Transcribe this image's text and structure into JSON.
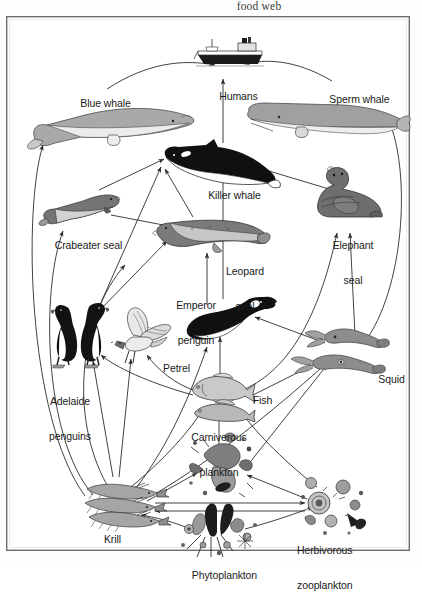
{
  "caption": "food web",
  "diagram": {
    "type": "food-web",
    "title": "food web",
    "region": "Antarctic / Southern Ocean",
    "frame": {
      "x": 6,
      "y": 16,
      "width": 404,
      "height": 535
    },
    "nodes": [
      {
        "id": "ship",
        "label": "",
        "icon": "ship-icon",
        "x": 223,
        "y": 45,
        "label_x": 223,
        "label_y": 68,
        "lines": []
      },
      {
        "id": "humans",
        "label": "Humans",
        "icon": "humans-icon",
        "x": 223,
        "y": 45,
        "label_x": 223,
        "label_y": 68,
        "lines": [
          "Humans"
        ]
      },
      {
        "id": "bluewhale",
        "label": "Blue whale",
        "icon": "blue-whale-icon",
        "x": 103,
        "y": 108,
        "label_x": 90,
        "label_y": 75,
        "lines": [
          "Blue whale"
        ]
      },
      {
        "id": "spermwhale",
        "label": "Sperm whale",
        "icon": "sperm-whale-icon",
        "x": 320,
        "y": 104,
        "label_x": 348,
        "label_y": 72,
        "lines": [
          "Sperm whale"
        ]
      },
      {
        "id": "killerwhale",
        "label": "Killer whale",
        "icon": "killer-whale-icon",
        "x": 215,
        "y": 145,
        "label_x": 220,
        "label_y": 168,
        "lines": [
          "Killer whale"
        ]
      },
      {
        "id": "crabeater",
        "label": "Crabeater seal",
        "icon": "crabeater-seal-icon",
        "x": 68,
        "y": 192,
        "label_x": 71,
        "label_y": 218,
        "lines": [
          "Crabeater seal"
        ]
      },
      {
        "id": "elephant",
        "label": "Elephant seal",
        "icon": "elephant-seal-icon",
        "x": 345,
        "y": 182,
        "label_x": 350,
        "label_y": 208,
        "lines": [
          "Elephant",
          "seal"
        ]
      },
      {
        "id": "leopard",
        "label": "Leopard seal",
        "icon": "leopard-seal-icon",
        "x": 208,
        "y": 214,
        "label_x": 237,
        "label_y": 233,
        "lines": [
          "Leopard",
          "seal"
        ]
      },
      {
        "id": "emperor",
        "label": "Emperor penguin",
        "icon": "emperor-penguin-icon",
        "x": 225,
        "y": 310,
        "label_x": 192,
        "label_y": 268,
        "lines": [
          "Emperor",
          "penguin"
        ]
      },
      {
        "id": "adelaide",
        "label": "Adelaide penguins",
        "icon": "adelaide-penguins-icon",
        "x": 73,
        "y": 310,
        "label_x": 62,
        "label_y": 364,
        "lines": [
          "Adelaide",
          "penguins"
        ]
      },
      {
        "id": "petrel",
        "label": "Petrel",
        "icon": "petrel-icon",
        "x": 133,
        "y": 315,
        "label_x": 161,
        "label_y": 341,
        "lines": [
          "Petrel"
        ]
      },
      {
        "id": "fish",
        "label": "Fish",
        "icon": "fish-icon",
        "x": 212,
        "y": 378,
        "label_x": 247,
        "label_y": 373,
        "lines": [
          "Fish"
        ]
      },
      {
        "id": "squid",
        "label": "Squid",
        "icon": "squid-icon",
        "x": 336,
        "y": 330,
        "label_x": 375,
        "label_y": 353,
        "lines": [
          "Squid"
        ]
      },
      {
        "id": "carnplank",
        "label": "Carniverous plankton",
        "icon": "carnivorous-plankton-icon",
        "x": 213,
        "y": 452,
        "label_x": 211,
        "label_y": 400,
        "lines": [
          "Carniverous",
          "plankton"
        ]
      },
      {
        "id": "krill",
        "label": "Krill",
        "icon": "krill-icon",
        "x": 118,
        "y": 492,
        "label_x": 97,
        "label_y": 513,
        "lines": [
          "Krill"
        ]
      },
      {
        "id": "herbzoo",
        "label": "Herbivorous zooplankton",
        "icon": "herbivorous-zooplankton-icon",
        "x": 327,
        "y": 489,
        "label_x": 335,
        "label_y": 513,
        "lines": [
          "Herbivorous",
          "zooplankton"
        ]
      },
      {
        "id": "phyto",
        "label": "Phytoplankton",
        "icon": "phytoplankton-icon",
        "x": 209,
        "y": 517,
        "label_x": 209,
        "label_y": 549,
        "lines": [
          "Phytoplankton"
        ]
      }
    ],
    "edges": [
      {
        "from": "bluewhale",
        "to": "humans",
        "style": "curve"
      },
      {
        "from": "spermwhale",
        "to": "humans",
        "style": "curve"
      },
      {
        "from": "killerwhale",
        "to": "humans",
        "style": "straight"
      },
      {
        "from": "crabeater",
        "to": "killerwhale",
        "style": "straight"
      },
      {
        "from": "leopard",
        "to": "killerwhale",
        "style": "straight"
      },
      {
        "from": "elephant",
        "to": "killerwhale",
        "style": "straight"
      },
      {
        "from": "emperor",
        "to": "killerwhale",
        "style": "straight"
      },
      {
        "from": "adelaide",
        "to": "killerwhale",
        "style": "straight"
      },
      {
        "from": "squid",
        "to": "spermwhale",
        "style": "curve"
      },
      {
        "from": "krill",
        "to": "bluewhale",
        "style": "curve"
      },
      {
        "from": "krill",
        "to": "crabeater",
        "style": "curve"
      },
      {
        "from": "crabeater",
        "to": "leopard",
        "style": "straight"
      },
      {
        "from": "emperor",
        "to": "leopard",
        "style": "straight"
      },
      {
        "from": "adelaide",
        "to": "leopard",
        "style": "straight"
      },
      {
        "from": "squid",
        "to": "elephant",
        "style": "straight"
      },
      {
        "from": "fish",
        "to": "elephant",
        "style": "straight"
      },
      {
        "from": "fish",
        "to": "emperor",
        "style": "straight"
      },
      {
        "from": "squid",
        "to": "emperor",
        "style": "straight"
      },
      {
        "from": "fish",
        "to": "petrel",
        "style": "straight"
      },
      {
        "from": "krill",
        "to": "petrel",
        "style": "straight"
      },
      {
        "from": "krill",
        "to": "adelaide",
        "style": "straight"
      },
      {
        "from": "fish",
        "to": "adelaide",
        "style": "straight"
      },
      {
        "from": "carnplank",
        "to": "fish",
        "style": "straight"
      },
      {
        "from": "krill",
        "to": "fish",
        "style": "straight"
      },
      {
        "from": "herbzoo",
        "to": "fish",
        "style": "straight"
      },
      {
        "from": "krill",
        "to": "carnplank",
        "style": "straight"
      },
      {
        "from": "herbzoo",
        "to": "carnplank",
        "style": "straight"
      },
      {
        "from": "phyto",
        "to": "krill",
        "style": "curve"
      },
      {
        "from": "phyto",
        "to": "herbzoo",
        "style": "curve"
      },
      {
        "from": "herbzoo",
        "to": "krill",
        "style": "double-straight"
      },
      {
        "from": "krill",
        "to": "squid",
        "style": "curve"
      },
      {
        "from": "fish",
        "to": "squid",
        "style": "straight"
      },
      {
        "from": "carnplank",
        "to": "squid",
        "style": "straight"
      },
      {
        "from": "krill",
        "to": "emperor",
        "style": "curve"
      },
      {
        "from": "krill",
        "to": "leopard",
        "style": "curve"
      }
    ]
  },
  "colors": {
    "frame_border": "#6c6c6c",
    "label_text": "#1a1a1a",
    "caption_text": "#3a3a3a",
    "arrow": "#2b2b2b",
    "fill_light": "#b8b8b8",
    "fill_mid": "#8f8f8f",
    "fill_dark": "#5e5e5e",
    "fill_black": "#121212",
    "paper": "#ffffff"
  }
}
